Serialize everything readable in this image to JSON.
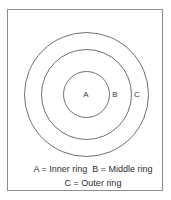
{
  "diagram": {
    "type": "concentric-circles",
    "title": "",
    "frame": {
      "border_color": "#8d8d8d",
      "background_color": "#ffffff"
    },
    "circles": [
      {
        "id": "outer",
        "label": "C",
        "name": "Outer ring",
        "stroke_color": "#6f6f6f"
      },
      {
        "id": "middle",
        "label": "B",
        "name": "Middle ring",
        "stroke_color": "#6f6f6f"
      },
      {
        "id": "inner",
        "label": "A",
        "name": "Inner ring",
        "stroke_color": "#6f6f6f"
      }
    ],
    "labels": {
      "inner": "A",
      "middle": "B",
      "outer": "C"
    },
    "caption": {
      "line1": "A = Inner ring  B = Middle ring",
      "line2": "C = Outer ring"
    }
  }
}
